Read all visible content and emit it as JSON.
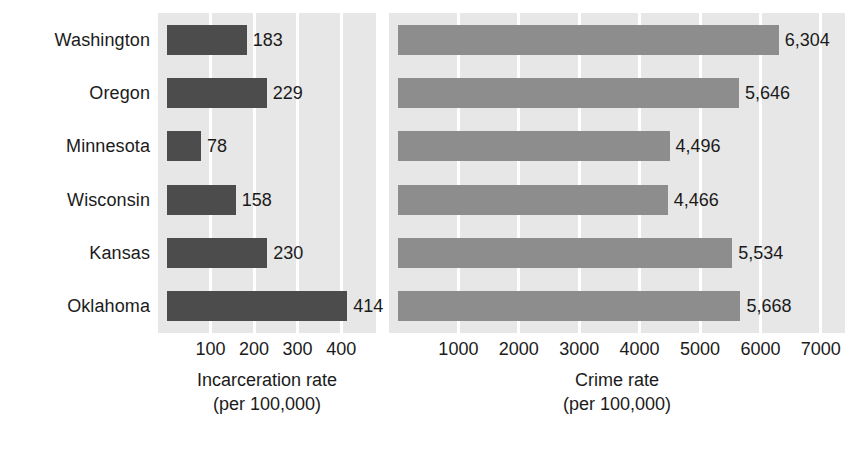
{
  "chart_data": {
    "type": "bar",
    "orientation": "horizontal",
    "title": "",
    "subtitle": "",
    "categories": [
      "Washington",
      "Oregon",
      "Minnesota",
      "Wisconsin",
      "Kansas",
      "Oklahoma"
    ],
    "panels": [
      {
        "id": "incarceration",
        "xlabel": "Incarceration rate",
        "xlabel_sub": "(per 100,000)",
        "ylabel": "",
        "xlim": [
          0,
          480
        ],
        "ticks": [
          100,
          200,
          300,
          400
        ],
        "tick_labels": [
          "100",
          "200",
          "300",
          "400"
        ],
        "grid": true,
        "grid_color": "#ffffff",
        "bar_color": "#4c4c4c",
        "plot_background": "#e7e7e7",
        "values": [
          183,
          229,
          78,
          158,
          230,
          414
        ],
        "value_labels": [
          "183",
          "229",
          "78",
          "158",
          "230",
          "414"
        ]
      },
      {
        "id": "crime",
        "xlabel": "Crime rate",
        "xlabel_sub": "(per 100,000)",
        "ylabel": "",
        "xlim": [
          0,
          7400
        ],
        "ticks": [
          1000,
          2000,
          3000,
          4000,
          5000,
          6000,
          7000
        ],
        "tick_labels": [
          "1000",
          "2000",
          "3000",
          "4000",
          "5000",
          "6000",
          "7000"
        ],
        "grid": true,
        "grid_color": "#ffffff",
        "bar_color": "#8d8d8d",
        "plot_background": "#e7e7e7",
        "values": [
          6304,
          5646,
          4496,
          4466,
          5534,
          5668
        ],
        "value_labels": [
          "6,304",
          "5,646",
          "4,496",
          "4,466",
          "5,534",
          "5,668"
        ]
      }
    ],
    "legend": [],
    "legend_position": "none"
  }
}
